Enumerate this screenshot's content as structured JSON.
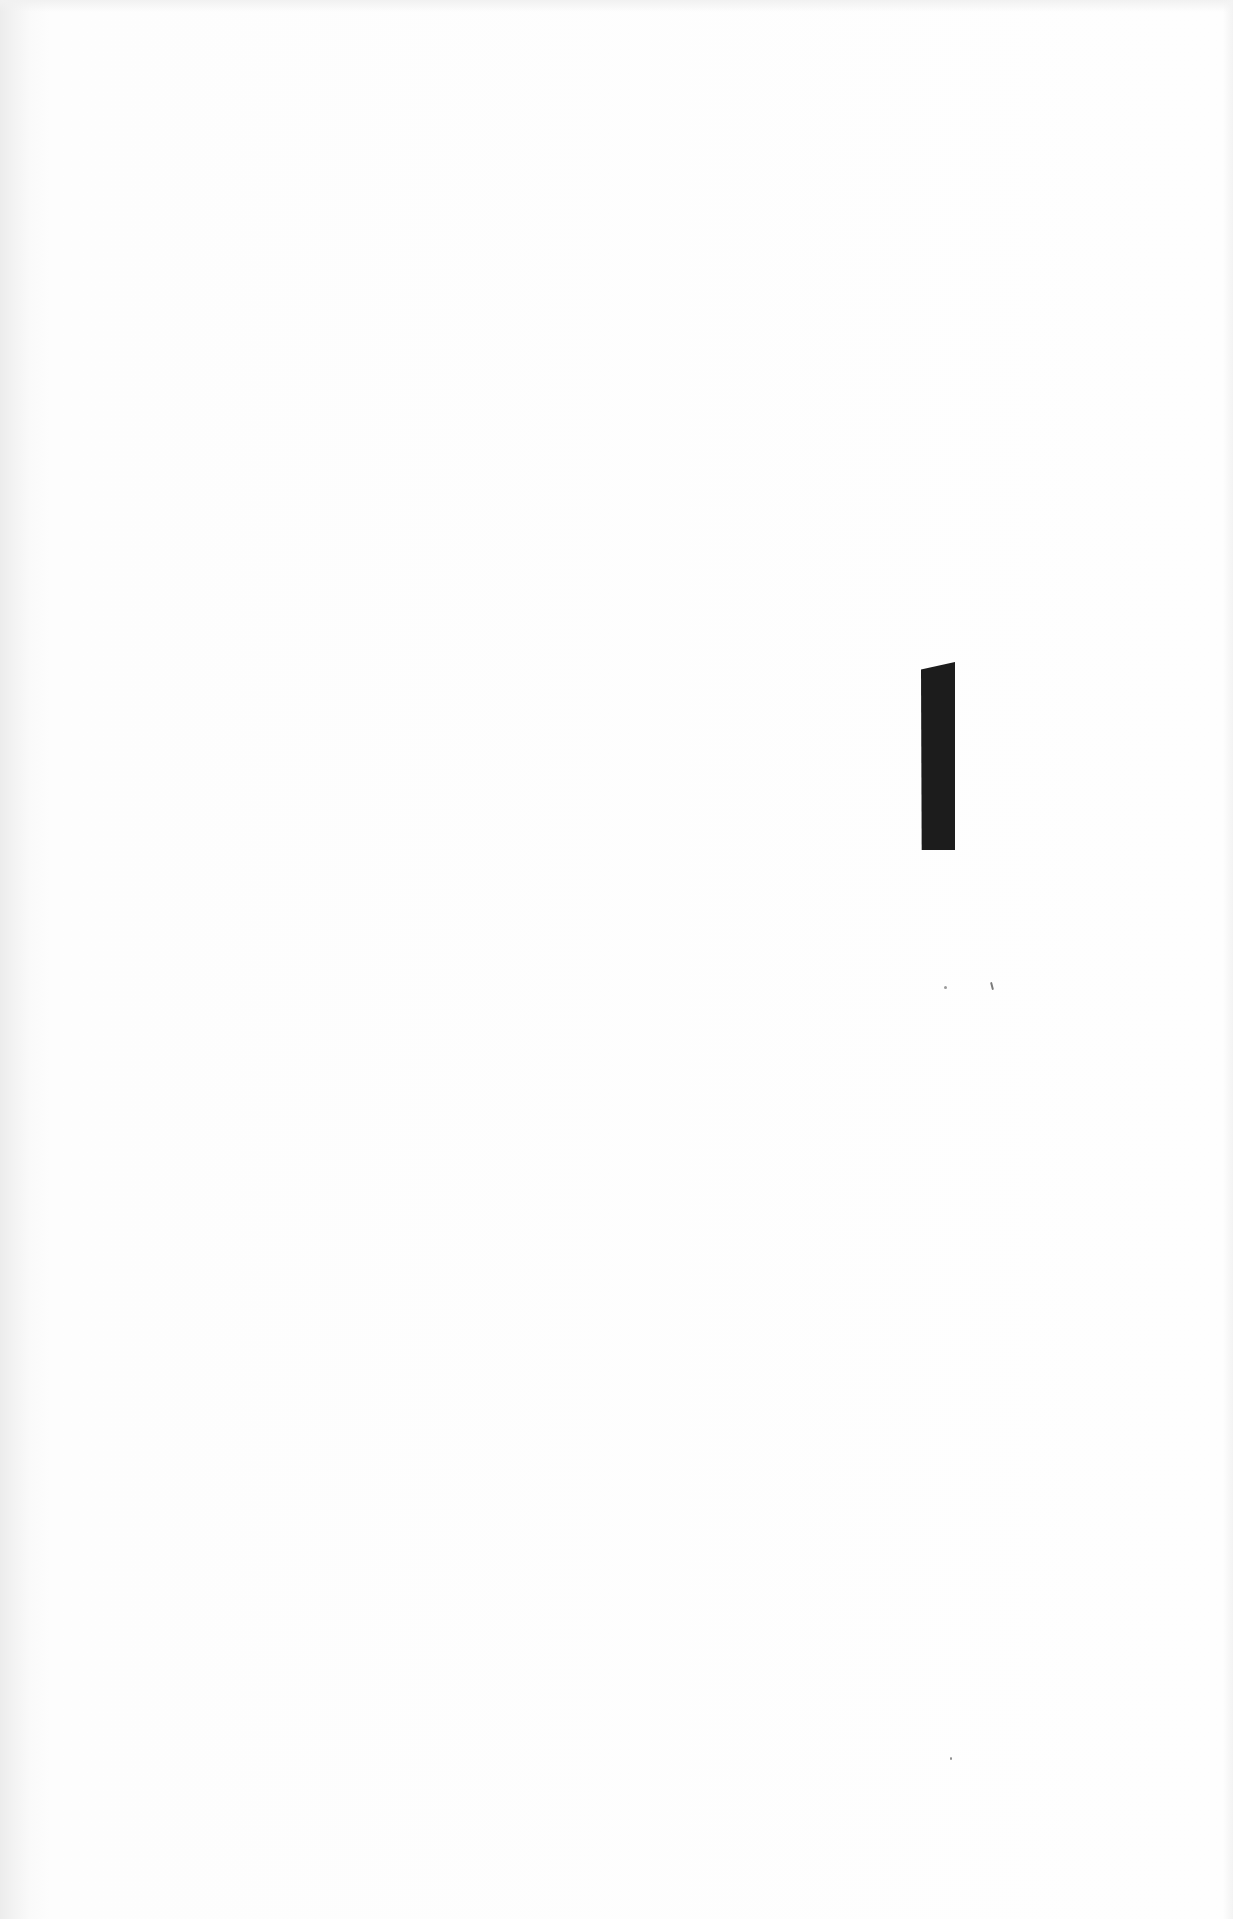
{
  "document": {
    "type": "scanned-blank-page",
    "text": "",
    "marker": {
      "shape": "vertical-bar",
      "color": "#1c1c1c"
    },
    "background_color": "#fdfdfd"
  }
}
